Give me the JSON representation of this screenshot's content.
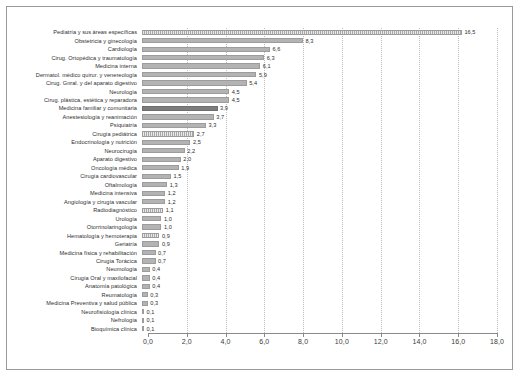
{
  "chart_data": {
    "type": "bar",
    "orientation": "horizontal",
    "title": "",
    "xlabel": "",
    "ylabel": "",
    "xlim": [
      0,
      18
    ],
    "xticks": [
      "0,0",
      "2,0",
      "4,0",
      "6,0",
      "8,0",
      "10,0",
      "12,0",
      "14,0",
      "16,0",
      "18,0"
    ],
    "xtick_values": [
      0,
      2,
      4,
      6,
      8,
      10,
      12,
      14,
      16,
      18
    ],
    "grid": true,
    "grid_axis": "x",
    "legend": "none",
    "decimal_separator": ",",
    "categories": [
      "Pediatría y sus áreas específicas",
      "Obstetricia y ginecología",
      "Cardiología",
      "Cirug. Ortopédica y traumatología",
      "Medicina interna",
      "Dermatol. médico quirur. y venereología",
      "Cirug. Gnral. y del aparato digestivo",
      "Neurología",
      "Cirug. plástica, estética y reparadora",
      "Medicina familiar y comunitaria",
      "Anestesiología y reanimación",
      "Psiquiatría",
      "Cirugía pediátrica",
      "Endocrinología y nutrición",
      "Neurocirugía",
      "Aparato digestivo",
      "Oncología médica",
      "Cirugía cardiovascular",
      "Oftalmología",
      "Medicina intensiva",
      "Angiología y cirugía vascular",
      "Radiodiagnóstico",
      "Urología",
      "Otorrinolaringología",
      "Hematología y hemoterapia",
      "Geriatría",
      "Medicina física y rehabilitación",
      "Cirugía Torácica",
      "Neumología",
      "Cirugía Oral y maxilofacial",
      "Anatomía patológica",
      "Reumatología",
      "Medicina Preventiva y salud pública",
      "Neurofisiología clínica",
      "Nefrología",
      "Bioquímica clínica"
    ],
    "values": [
      16.5,
      8.3,
      6.6,
      6.3,
      6.1,
      5.9,
      5.4,
      4.5,
      4.5,
      3.9,
      3.7,
      3.3,
      2.7,
      2.5,
      2.2,
      2.0,
      1.9,
      1.5,
      1.3,
      1.2,
      1.2,
      1.1,
      1.0,
      1.0,
      0.9,
      0.9,
      0.7,
      0.7,
      0.4,
      0.4,
      0.4,
      0.3,
      0.3,
      0.1,
      0.1,
      0.1
    ],
    "value_labels": [
      "16,5",
      "8,3",
      "6,6",
      "6,3",
      "6,1",
      "5,9",
      "5,4",
      "4,5",
      "4,5",
      "3,9",
      "3,7",
      "3,3",
      "2,7",
      "2,5",
      "2,2",
      "2,0",
      "1,9",
      "1,5",
      "1,3",
      "1,2",
      "1,2",
      "1,1",
      "1,0",
      "1,0",
      "0,9",
      "0,9",
      "0,7",
      "0,7",
      "0,4",
      "0,4",
      "0,4",
      "0,3",
      "0,3",
      "0,1",
      "0,1",
      "0,1"
    ],
    "bar_styles": [
      "hatched",
      "plain",
      "plain",
      "plain",
      "plain",
      "plain",
      "plain",
      "plain",
      "plain",
      "dark",
      "plain",
      "plain",
      "hatched",
      "plain",
      "plain",
      "plain",
      "plain",
      "plain",
      "plain",
      "plain",
      "plain",
      "hatched",
      "plain",
      "plain",
      "hatched",
      "plain",
      "plain",
      "plain",
      "plain",
      "plain",
      "plain",
      "plain",
      "plain",
      "plain",
      "plain",
      "plain"
    ],
    "colors": {
      "bar": "#b3b3b3",
      "bar_highlight": "#7d7d7d",
      "grid": "#bdbdbd",
      "axis": "#8a8a8a",
      "text": "#2e2e2e",
      "frame": "#9a9a9a",
      "background": "#ffffff"
    }
  }
}
